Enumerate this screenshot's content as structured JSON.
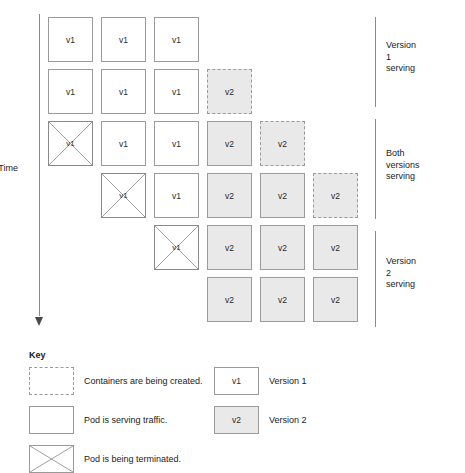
{
  "axis": {
    "label": "Time",
    "direction": "downward"
  },
  "grid": {
    "columns": 6,
    "column_pitch_px": 53,
    "box_size_px": 45,
    "row_pitch_px": 52,
    "rows": [
      {
        "index": 1,
        "cells": [
          {
            "col": 1,
            "state": "serving",
            "version": "v1",
            "label": "v1"
          },
          {
            "col": 2,
            "state": "serving",
            "version": "v1",
            "label": "v1"
          },
          {
            "col": 3,
            "state": "serving",
            "version": "v1",
            "label": "v1"
          }
        ]
      },
      {
        "index": 2,
        "cells": [
          {
            "col": 1,
            "state": "serving",
            "version": "v1",
            "label": "v1"
          },
          {
            "col": 2,
            "state": "serving",
            "version": "v1",
            "label": "v1"
          },
          {
            "col": 3,
            "state": "serving",
            "version": "v1",
            "label": "v1"
          },
          {
            "col": 4,
            "state": "creating",
            "version": "v2",
            "label": "v2"
          }
        ]
      },
      {
        "index": 3,
        "cells": [
          {
            "col": 1,
            "state": "terminating",
            "version": "v1",
            "label": "v1"
          },
          {
            "col": 2,
            "state": "serving",
            "version": "v1",
            "label": "v1"
          },
          {
            "col": 3,
            "state": "serving",
            "version": "v1",
            "label": "v1"
          },
          {
            "col": 4,
            "state": "serving",
            "version": "v2",
            "label": "v2"
          },
          {
            "col": 5,
            "state": "creating",
            "version": "v2",
            "label": "v2"
          }
        ]
      },
      {
        "index": 4,
        "cells": [
          {
            "col": 2,
            "state": "terminating",
            "version": "v1",
            "label": "v1"
          },
          {
            "col": 3,
            "state": "serving",
            "version": "v1",
            "label": "v1"
          },
          {
            "col": 4,
            "state": "serving",
            "version": "v2",
            "label": "v2"
          },
          {
            "col": 5,
            "state": "serving",
            "version": "v2",
            "label": "v2"
          },
          {
            "col": 6,
            "state": "creating",
            "version": "v2",
            "label": "v2"
          }
        ]
      },
      {
        "index": 5,
        "cells": [
          {
            "col": 3,
            "state": "terminating",
            "version": "v1",
            "label": "v1"
          },
          {
            "col": 4,
            "state": "serving",
            "version": "v2",
            "label": "v2"
          },
          {
            "col": 5,
            "state": "serving",
            "version": "v2",
            "label": "v2"
          },
          {
            "col": 6,
            "state": "serving",
            "version": "v2",
            "label": "v2"
          }
        ]
      },
      {
        "index": 6,
        "cells": [
          {
            "col": 4,
            "state": "serving",
            "version": "v2",
            "label": "v2"
          },
          {
            "col": 5,
            "state": "serving",
            "version": "v2",
            "label": "v2"
          },
          {
            "col": 6,
            "state": "serving",
            "version": "v2",
            "label": "v2"
          }
        ]
      }
    ]
  },
  "phases": [
    {
      "id": "version-1-serving",
      "label": "Version 1 serving",
      "top_px": 17,
      "height_px": 90,
      "label_top_px": 40
    },
    {
      "id": "both-versions-serving",
      "label": "Both versions\nserving",
      "top_px": 119,
      "height_px": 100,
      "label_top_px": 148
    },
    {
      "id": "version-2-serving",
      "label": "Version 2 serving",
      "top_px": 231,
      "height_px": 96,
      "label_top_px": 256
    }
  ],
  "key": {
    "title": "Key",
    "state_entries": [
      {
        "id": "creating",
        "swatch": "dashed",
        "text": "Containers are being created."
      },
      {
        "id": "serving",
        "swatch": "solid",
        "text": "Pod is serving traffic."
      },
      {
        "id": "terminating",
        "swatch": "crossed",
        "text": "Pod is being terminated."
      }
    ],
    "version_entries": [
      {
        "id": "version-1",
        "swatch": "solid",
        "badge": "v1",
        "text": "Version 1"
      },
      {
        "id": "version-2",
        "swatch": "shaded",
        "badge": "v2",
        "text": "Version 2"
      }
    ]
  },
  "colors": {
    "line": "#9a9a9a",
    "shaded_fill": "#e9e9e9",
    "text": "#1a1a1a",
    "background": "#ffffff"
  }
}
